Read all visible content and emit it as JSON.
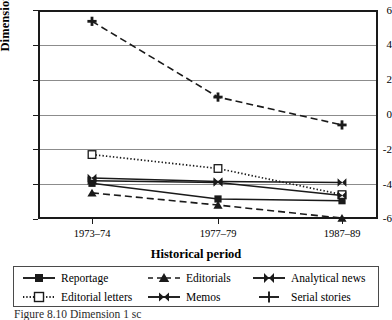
{
  "chart_data": {
    "type": "line",
    "title": "",
    "xlabel": "Historical period",
    "ylabel": "Dimension score",
    "categories": [
      "1973–74",
      "1977–79",
      "1987–89"
    ],
    "ylim": [
      -6,
      6
    ],
    "yticks": [
      6,
      4,
      2,
      0,
      -2,
      -4,
      -6
    ],
    "ytick_labels": [
      "6",
      "4",
      "2",
      "0",
      "-2",
      "-4",
      "-6"
    ],
    "grid": true,
    "legend_position": "bottom",
    "series": [
      {
        "name": "Reportage",
        "values": [
          -3.95,
          -4.85,
          -4.95
        ],
        "line": "solid",
        "marker": "filled-square"
      },
      {
        "name": "Editorials",
        "values": [
          -4.5,
          -5.2,
          -5.95
        ],
        "line": "dashed",
        "marker": "filled-triangle"
      },
      {
        "name": "Analytical news",
        "values": [
          -3.65,
          -3.85,
          -3.9
        ],
        "line": "solid",
        "marker": "bowtie"
      },
      {
        "name": "Editorial letters",
        "values": [
          -2.3,
          -3.1,
          -4.6
        ],
        "line": "dotted",
        "marker": "open-square"
      },
      {
        "name": "Memos",
        "values": [
          -3.8,
          -3.9,
          -4.65
        ],
        "line": "solid",
        "marker": "bowtie"
      },
      {
        "name": "Serial stories",
        "values": [
          5.35,
          1.0,
          -0.6
        ],
        "line": "dashed",
        "marker": "plus"
      }
    ]
  },
  "axes": {
    "y_title": "Dimension score",
    "x_title": "Historical period",
    "y_tick_labels": [
      "6",
      "4",
      "2",
      "0",
      "-2",
      "-4",
      "-6"
    ],
    "x_tick_labels": [
      "1973–74",
      "1977–79",
      "1987–89"
    ]
  },
  "legend": {
    "entries": [
      {
        "label": "Reportage"
      },
      {
        "label": "Editorials"
      },
      {
        "label": "Analytical news"
      },
      {
        "label": "Editorial letters"
      },
      {
        "label": "Memos"
      },
      {
        "label": "Serial stories"
      }
    ]
  },
  "caption": {
    "text": "Figure  8.10 Dimension 1 sc"
  },
  "colors": {
    "line": "#1a1a1a",
    "grid": "#8c8c8c",
    "frame": "#1a1a1a",
    "background": "#ffffff"
  }
}
